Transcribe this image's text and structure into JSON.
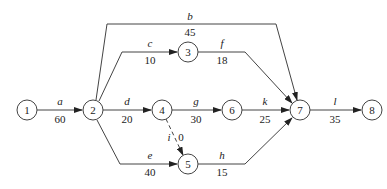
{
  "diagram": {
    "type": "activity-on-arrow network",
    "nodes": [
      {
        "id": "1",
        "label": "1",
        "x": 27,
        "y": 110
      },
      {
        "id": "2",
        "label": "2",
        "x": 93,
        "y": 110
      },
      {
        "id": "3",
        "label": "3",
        "x": 188,
        "y": 52
      },
      {
        "id": "4",
        "label": "4",
        "x": 162,
        "y": 110
      },
      {
        "id": "5",
        "label": "5",
        "x": 188,
        "y": 164
      },
      {
        "id": "6",
        "label": "6",
        "x": 232,
        "y": 110
      },
      {
        "id": "7",
        "label": "7",
        "x": 300,
        "y": 110
      },
      {
        "id": "8",
        "label": "8",
        "x": 372,
        "y": 110
      }
    ],
    "edges": [
      {
        "activity": "a",
        "duration": "60",
        "from": "1",
        "to": "2",
        "dashed": false
      },
      {
        "activity": "b",
        "duration": "45",
        "from": "2",
        "to": "7",
        "dashed": false
      },
      {
        "activity": "c",
        "duration": "10",
        "from": "2",
        "to": "3",
        "dashed": false
      },
      {
        "activity": "d",
        "duration": "20",
        "from": "2",
        "to": "4",
        "dashed": false
      },
      {
        "activity": "e",
        "duration": "40",
        "from": "2",
        "to": "5",
        "dashed": false
      },
      {
        "activity": "f",
        "duration": "18",
        "from": "3",
        "to": "7",
        "dashed": false
      },
      {
        "activity": "g",
        "duration": "30",
        "from": "4",
        "to": "6",
        "dashed": false
      },
      {
        "activity": "h",
        "duration": "15",
        "from": "5",
        "to": "7",
        "dashed": false
      },
      {
        "activity": "i",
        "duration": "0",
        "from": "4",
        "to": "5",
        "dashed": true
      },
      {
        "activity": "k",
        "duration": "25",
        "from": "6",
        "to": "7",
        "dashed": false
      },
      {
        "activity": "l",
        "duration": "35",
        "from": "7",
        "to": "8",
        "dashed": false
      }
    ]
  },
  "colors": {
    "line": "#444444",
    "text": "#222222",
    "background": "#ffffff"
  }
}
